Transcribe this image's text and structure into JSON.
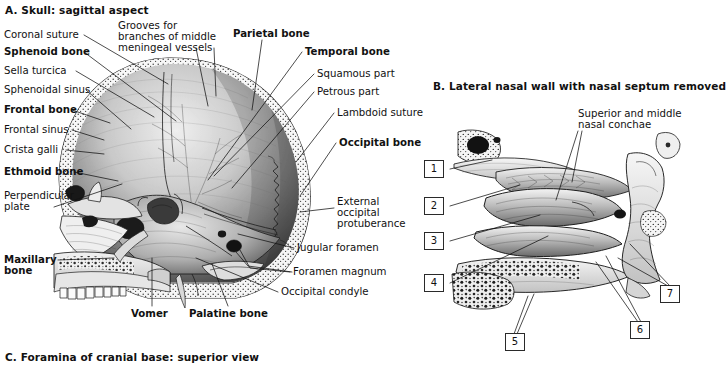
{
  "figure": {
    "background_color": "#ffffff",
    "ink_color": "#111111"
  },
  "panel_a": {
    "title": "A. Skull: sagittal aspect",
    "labels_left": [
      {
        "text": "Coronal suture",
        "bold": false
      },
      {
        "text": "Sphenoid bone",
        "bold": true
      },
      {
        "text": "Sella turcica",
        "bold": false
      },
      {
        "text": "Sphenoidal sinus",
        "bold": false
      },
      {
        "text": "Frontal bone",
        "bold": true
      },
      {
        "text": "Frontal sinus",
        "bold": false
      },
      {
        "text": "Crista galli",
        "bold": false
      },
      {
        "text": "Ethmoid bone",
        "bold": true
      },
      {
        "text": "Perpendicular\nplate",
        "bold": false
      },
      {
        "text": "Maxillary\nbone",
        "bold": true
      }
    ],
    "labels_top": [
      {
        "text": "Grooves for\nbranches of middle\nmeningeal vessels",
        "bold": false
      },
      {
        "text": "Parietal bone",
        "bold": true
      }
    ],
    "labels_right": [
      {
        "text": "Temporal bone",
        "bold": true
      },
      {
        "text": "Squamous part",
        "bold": false
      },
      {
        "text": "Petrous part",
        "bold": false
      },
      {
        "text": "Lambdoid suture",
        "bold": false
      },
      {
        "text": "Occipital bone",
        "bold": true
      },
      {
        "text": "External\noccipital\nprotuberance",
        "bold": false
      },
      {
        "text": "Jugular foramen",
        "bold": false
      },
      {
        "text": "Foramen magnum",
        "bold": false
      },
      {
        "text": "Occipital condyle",
        "bold": false
      }
    ],
    "labels_bottom": [
      {
        "text": "Vomer",
        "bold": true
      },
      {
        "text": "Palatine bone",
        "bold": true
      }
    ]
  },
  "panel_b": {
    "title": "B. Lateral nasal wall with nasal septum removed",
    "callout": "Superior and middle\nnasal conchae",
    "number_boxes": [
      "1",
      "2",
      "3",
      "4",
      "5",
      "6",
      "7"
    ]
  },
  "panel_c": {
    "title": "C. Foramina of cranial base: superior view"
  }
}
